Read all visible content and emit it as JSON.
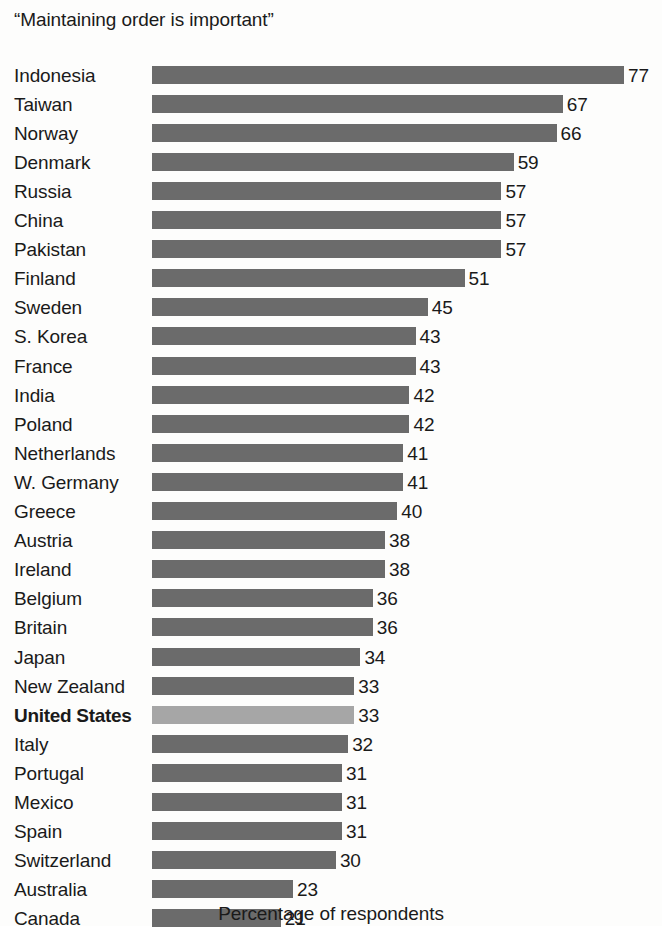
{
  "chart_data": {
    "type": "bar",
    "orientation": "horizontal",
    "title": "“Maintaining order is important”",
    "xlabel": "Percentage of respondents",
    "ylabel": "",
    "xlim": [
      0,
      77
    ],
    "grid": false,
    "legend": false,
    "value_label_suffix": "",
    "categories": [
      "Indonesia",
      "Taiwan",
      "Norway",
      "Denmark",
      "Russia",
      "China",
      "Pakistan",
      "Finland",
      "Sweden",
      "S. Korea",
      "France",
      "India",
      "Poland",
      "Netherlands",
      "W. Germany",
      "Greece",
      "Austria",
      "Ireland",
      "Belgium",
      "Britain",
      "Japan",
      "New Zealand",
      "United States",
      "Italy",
      "Portugal",
      "Mexico",
      "Spain",
      "Switzerland",
      "Australia",
      "Canada"
    ],
    "values": [
      77,
      67,
      66,
      59,
      57,
      57,
      57,
      51,
      45,
      43,
      43,
      42,
      42,
      41,
      41,
      40,
      38,
      38,
      36,
      36,
      34,
      33,
      33,
      32,
      31,
      31,
      31,
      30,
      23,
      21
    ],
    "highlighted_categories": [
      "United States"
    ],
    "colors": {
      "bar": "#6b6b6b",
      "bar_highlight": "#a6a6a6",
      "text": "#1a1a1a",
      "background": "#fdfdfc"
    }
  }
}
